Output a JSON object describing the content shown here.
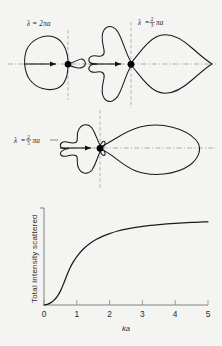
{
  "figure": {
    "background_color": "#f4f4f2",
    "ink_color": "#1a1a1a",
    "axis_color": "#8c8c8c"
  },
  "polar_diagrams": [
    {
      "id": "diagram-1",
      "label_prefix": "λ",
      "label_equals": "=",
      "label_value": "2πa",
      "label_full": "λ = 2πa",
      "has_fraction": false,
      "fraction_numerator": "",
      "fraction_denominator": "",
      "fraction_suffix": "",
      "description": "Large rounded back lobe with small forward bump",
      "incident_arrow": "right",
      "center_marker": "scatterer-dot"
    },
    {
      "id": "diagram-2",
      "label_prefix": "λ",
      "label_equals": "=",
      "label_value": "⅔πa",
      "label_full": "λ = 2/3 πa",
      "has_fraction": true,
      "fraction_numerator": "2",
      "fraction_denominator": "3",
      "fraction_suffix": "πa",
      "description": "Wavy back lobe with large pointed forward lobe",
      "incident_arrow": "right",
      "center_marker": "scatterer-dot"
    },
    {
      "id": "diagram-3",
      "label_prefix": "λ",
      "label_equals": "=",
      "label_value": "⅖πa",
      "label_full": "λ = 2/5 πa",
      "has_fraction": true,
      "fraction_numerator": "2",
      "fraction_denominator": "5",
      "fraction_suffix": "πa",
      "description": "Small spiky back lobe with very large elongated forward lobe",
      "incident_arrow": "right",
      "center_marker": "scatterer-dot"
    }
  ],
  "chart_data": {
    "type": "line",
    "title": "",
    "xlabel": "ka",
    "ylabel": "Total intensity scattered",
    "xlim": [
      0,
      5
    ],
    "ylim": [
      0,
      1.08
    ],
    "grid": false,
    "legend": null,
    "xticks": [
      0,
      1,
      2,
      3,
      4,
      5
    ],
    "xtick_labels": [
      "0",
      "1",
      "2",
      "3",
      "4",
      "5"
    ],
    "yticks": [],
    "ytick_labels": [],
    "x": [
      0.0,
      0.1,
      0.2,
      0.3,
      0.4,
      0.5,
      0.6,
      0.7,
      0.8,
      0.9,
      1.0,
      1.2,
      1.4,
      1.6,
      1.8,
      2.0,
      2.25,
      2.5,
      2.75,
      3.0,
      3.25,
      3.5,
      3.75,
      4.0,
      4.25,
      4.5,
      4.75,
      5.0
    ],
    "y": [
      0.0,
      0.008,
      0.025,
      0.055,
      0.1,
      0.165,
      0.255,
      0.355,
      0.445,
      0.515,
      0.575,
      0.665,
      0.73,
      0.78,
      0.818,
      0.848,
      0.878,
      0.9,
      0.918,
      0.932,
      0.944,
      0.954,
      0.962,
      0.969,
      0.975,
      0.98,
      0.984,
      0.987
    ]
  }
}
